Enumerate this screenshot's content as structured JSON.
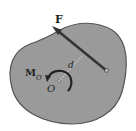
{
  "diagram": {
    "labels": {
      "force": "F",
      "moment": "M",
      "moment_sub": "O",
      "point": "O",
      "distance": "d"
    },
    "colors": {
      "body_fill": "#9a9a9a",
      "body_stroke": "#444444",
      "vector": "#333333",
      "background": "#ffffff"
    }
  }
}
